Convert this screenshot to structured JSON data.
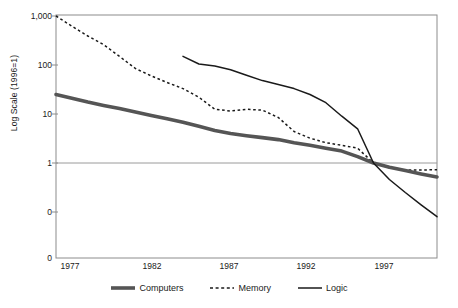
{
  "chart_data": {
    "type": "line",
    "title": "",
    "subtitle": "",
    "xlabel": "",
    "ylabel": "Log Scale (1996=1)",
    "x_tick_labels": [
      "1977",
      "1982",
      "1987",
      "1992",
      "1997"
    ],
    "x_tick_values": [
      1977,
      1982,
      1987,
      1992,
      1997
    ],
    "y_tick_labels": [
      "1,000",
      "100",
      "10",
      "1",
      "0",
      "0"
    ],
    "y_tick_values": [
      1000,
      100,
      10,
      1,
      0.1,
      0.01
    ],
    "xlim": [
      1977,
      2001
    ],
    "ylim": [
      0.01,
      1000
    ],
    "yscale": "log",
    "grid": "single horizontal gridline at y = 1",
    "gridline_value": 1,
    "legend_position": "bottom-center",
    "series": [
      {
        "name": "Computers",
        "style": "solid-thick",
        "color": "#555555",
        "x": [
          1977,
          1978,
          1979,
          1980,
          1981,
          1982,
          1983,
          1984,
          1985,
          1986,
          1987,
          1988,
          1989,
          1990,
          1991,
          1992,
          1993,
          1994,
          1995,
          1996,
          1997,
          1998,
          1999,
          2000,
          2001
        ],
        "values": [
          25,
          21,
          17.5,
          15,
          13,
          11,
          9.3,
          8.0,
          6.8,
          5.6,
          4.6,
          4.0,
          3.6,
          3.3,
          3.0,
          2.6,
          2.3,
          2.0,
          1.75,
          1.35,
          1.0,
          0.82,
          0.7,
          0.6,
          0.52
        ]
      },
      {
        "name": "Memory",
        "style": "dashed",
        "color": "#1a1a1a",
        "x": [
          1977,
          1978,
          1979,
          1980,
          1981,
          1982,
          1983,
          1984,
          1985,
          1986,
          1987,
          1988,
          1989,
          1990,
          1991,
          1992,
          1993,
          1994,
          1995,
          1996,
          1997,
          1998,
          1999,
          2000,
          2001
        ],
        "values": [
          1000,
          620,
          390,
          260,
          150,
          85,
          60,
          44,
          33,
          22,
          12.5,
          11.5,
          12.5,
          12.0,
          8.5,
          4.4,
          3.2,
          2.6,
          2.3,
          2.0,
          1.0,
          0.8,
          0.72,
          0.72,
          0.73
        ]
      },
      {
        "name": "Logic",
        "style": "solid-thin",
        "color": "#1a1a1a",
        "x": [
          1985,
          1986,
          1987,
          1988,
          1989,
          1990,
          1991,
          1992,
          1993,
          1994,
          1995,
          1996,
          1997,
          1998,
          1999,
          2000,
          2001
        ],
        "values": [
          150,
          105,
          95,
          80,
          62,
          48,
          40,
          33,
          25,
          17,
          9.0,
          5.0,
          1.0,
          0.46,
          0.25,
          0.14,
          0.08
        ]
      }
    ]
  },
  "axes": {
    "y_title": "Log Scale (1996=1)",
    "y_ticks": [
      {
        "label": "1,000"
      },
      {
        "label": "100"
      },
      {
        "label": "10"
      },
      {
        "label": "1"
      },
      {
        "label": "0"
      },
      {
        "label": "0"
      }
    ],
    "x_ticks": [
      {
        "label": "1977"
      },
      {
        "label": "1982"
      },
      {
        "label": "1987"
      },
      {
        "label": "1992"
      },
      {
        "label": "1997"
      }
    ]
  },
  "legend": {
    "items": [
      {
        "label": "Computers",
        "icon": "thick-line-swatch"
      },
      {
        "label": "Memory",
        "icon": "dashed-line-swatch"
      },
      {
        "label": "Logic",
        "icon": "thin-line-swatch"
      }
    ]
  }
}
